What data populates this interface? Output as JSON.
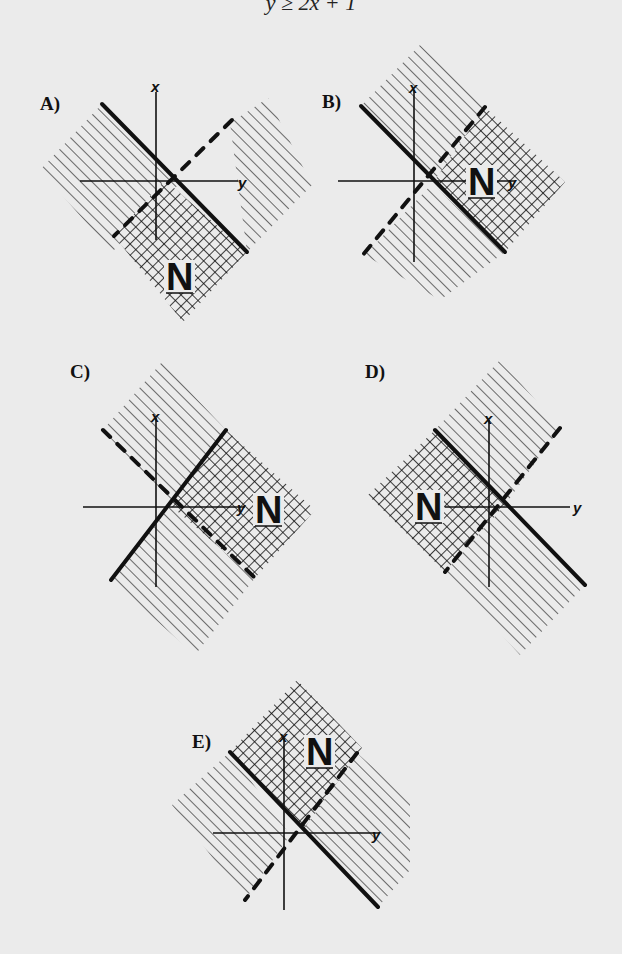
{
  "header": {
    "text": "y ≥ 2x + 1"
  },
  "colors": {
    "background": "#ebebeb",
    "ink": "#111111"
  },
  "legend": {
    "region_label": "N"
  },
  "panels": [
    {
      "id": "A",
      "label": "A)",
      "label_pos": [
        40,
        110
      ],
      "axes": {
        "x_axis": {
          "x": 156,
          "y1": 92,
          "y2": 240,
          "label": "x",
          "label_pos": [
            151,
            92
          ]
        },
        "y_axis": {
          "y": 181,
          "x1": 80,
          "x2": 238,
          "label": "y",
          "label_pos": [
            238,
            188
          ]
        }
      },
      "hatch_regions": [
        {
          "points": "40,170 102,104 180,183 112,252"
        },
        {
          "points": "230,123 268,98 312,185 247,252"
        }
      ],
      "crosshatch_region": {
        "points": "165,180 247,252 183,322 114,236"
      },
      "solid_line": {
        "x1": 102,
        "y1": 104,
        "x2": 247,
        "y2": 252
      },
      "dashed_line": {
        "x1": 232,
        "y1": 120,
        "x2": 114,
        "y2": 236
      },
      "n_pos": [
        166,
        290
      ]
    },
    {
      "id": "B",
      "label": "B)",
      "label_pos": [
        322,
        108
      ],
      "axes": {
        "x_axis": {
          "x": 414,
          "y1": 90,
          "y2": 262,
          "label": "x",
          "label_pos": [
            409,
            93
          ]
        },
        "y_axis": {
          "y": 181,
          "x1": 338,
          "x2": 515,
          "label": "y",
          "label_pos": [
            508,
            188
          ]
        }
      },
      "hatch_regions": [
        {
          "points": "361,106 420,45 485,107 435,180"
        },
        {
          "points": "432,184 505,252 440,300 365,255"
        }
      ],
      "crosshatch_region": {
        "points": "485,107 565,182 505,252 435,180"
      },
      "solid_line": {
        "x1": 361,
        "y1": 106,
        "x2": 505,
        "y2": 252
      },
      "dashed_line": {
        "x1": 485,
        "y1": 107,
        "x2": 362,
        "y2": 256
      },
      "n_pos": [
        468,
        195
      ]
    },
    {
      "id": "C",
      "label": "C)",
      "label_pos": [
        70,
        378
      ],
      "axes": {
        "x_axis": {
          "x": 156,
          "y1": 418,
          "y2": 587,
          "label": "x",
          "label_pos": [
            151,
            422
          ]
        },
        "y_axis": {
          "y": 507,
          "x1": 83,
          "x2": 245,
          "label": "y",
          "label_pos": [
            237,
            513
          ]
        }
      },
      "hatch_regions": [
        {
          "points": "103,430 162,362 226,430 170,505"
        },
        {
          "points": "111,580 170,507 255,578 195,655"
        }
      ],
      "crosshatch_region": {
        "points": "226,430 315,510 255,578 170,505"
      },
      "solid_line": {
        "x1": 226,
        "y1": 430,
        "x2": 111,
        "y2": 580
      },
      "dashed_line": {
        "x1": 103,
        "y1": 430,
        "x2": 255,
        "y2": 578
      },
      "n_pos": [
        255,
        523
      ]
    },
    {
      "id": "D",
      "label": "D)",
      "label_pos": [
        365,
        378
      ],
      "axes": {
        "x_axis": {
          "x": 489,
          "y1": 420,
          "y2": 587,
          "label": "x",
          "label_pos": [
            484,
            424
          ]
        },
        "y_axis": {
          "y": 507,
          "x1": 445,
          "x2": 570,
          "label": "y",
          "label_pos": [
            573,
            513
          ]
        }
      },
      "hatch_regions": [
        {
          "points": "435,430 500,360 560,428 505,505"
        },
        {
          "points": "505,505 585,585 520,655 445,572"
        }
      ],
      "crosshatch_region": {
        "points": "435,430 505,505 445,572 368,495"
      },
      "solid_line": {
        "x1": 435,
        "y1": 430,
        "x2": 585,
        "y2": 585
      },
      "dashed_line": {
        "x1": 560,
        "y1": 428,
        "x2": 445,
        "y2": 572
      },
      "n_pos": [
        415,
        520
      ]
    },
    {
      "id": "E",
      "label": "E)",
      "label_pos": [
        192,
        748
      ],
      "axes": {
        "x_axis": {
          "x": 284,
          "y1": 738,
          "y2": 910,
          "label": "x",
          "label_pos": [
            279,
            742
          ]
        },
        "y_axis": {
          "y": 833,
          "x1": 213,
          "x2": 380,
          "label": "y",
          "label_pos": [
            372,
            840
          ]
        }
      },
      "hatch_regions": [
        {
          "points": "172,805 230,752 290,835 245,900"
        },
        {
          "points": "357,753 410,800 410,870 378,907 303,830"
        }
      ],
      "crosshatch_region": {
        "points": "297,680 362,748 303,830 230,752"
      },
      "solid_line": {
        "x1": 230,
        "y1": 752,
        "x2": 378,
        "y2": 907
      },
      "dashed_line": {
        "x1": 357,
        "y1": 753,
        "x2": 245,
        "y2": 900
      },
      "n_pos": [
        306,
        765
      ]
    }
  ]
}
